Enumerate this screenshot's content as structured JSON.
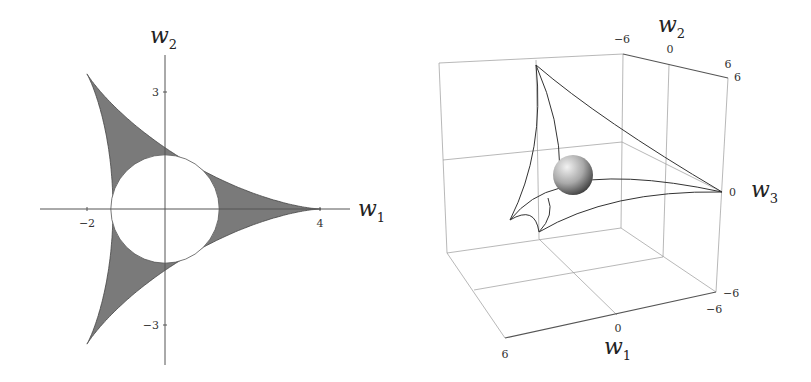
{
  "chart_data": [
    {
      "type": "area",
      "title": "",
      "description": "2D deltoid region (shaded) with inscribed white disk",
      "xlabel": "w1",
      "ylabel": "w2",
      "x_ticks": [
        -2,
        4
      ],
      "y_ticks": [
        3,
        -3
      ],
      "xlim": [
        -3.2,
        4.8
      ],
      "ylim": [
        -4.6,
        4.6
      ],
      "deltoid": {
        "R": 1.3333,
        "cusps": [
          [
            4,
            0
          ],
          [
            -2,
            3.464
          ],
          [
            -2,
            -3.464
          ]
        ]
      },
      "inscribed_circle": {
        "center": [
          0,
          0
        ],
        "radius": 1.39
      },
      "fill_color": "#7a7a7a",
      "grid": false
    },
    {
      "type": "scatter",
      "description": "3D box plot of deltoid curves with a shaded sphere at the center",
      "xlabel": "w1",
      "ylabel": "w2",
      "zlabel": "w3",
      "w1_ticks": [
        "6",
        "0",
        "-6"
      ],
      "w2_ticks": [
        "-6",
        "0",
        "6"
      ],
      "w3_ticks": [
        "6",
        "0",
        "-6"
      ],
      "range": [
        -6,
        6
      ],
      "sphere": {
        "center": [
          0,
          0,
          0
        ]
      }
    }
  ],
  "left": {
    "xlabel": "w",
    "xlabel_sub": "1",
    "ylabel": "w",
    "ylabel_sub": "2",
    "ticks": {
      "xneg": "−2",
      "xpos": "4",
      "ypos": "3",
      "yneg": "−3"
    }
  },
  "right": {
    "w1": "w",
    "w1_sub": "1",
    "w2": "w",
    "w2_sub": "2",
    "w3": "w",
    "w3_sub": "3",
    "ticks": {
      "w2_neg": "−6",
      "w2_zero": "0",
      "w2_pos": "6",
      "w3_pos": "6",
      "w3_zero": "0",
      "w3_neg": "−6",
      "w1_pos": "6",
      "w1_zero": "0",
      "w1_neg": "−6"
    }
  }
}
